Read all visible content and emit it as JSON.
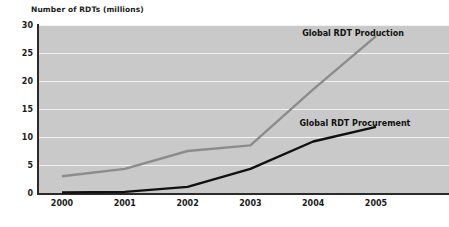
{
  "chart_data": {
    "type": "line",
    "title": "Number of RDTs (millions)",
    "xlabel": "",
    "ylabel": "Number of RDTs (millions)",
    "x": [
      "2000",
      "2001",
      "2002",
      "2003",
      "2004",
      "2005"
    ],
    "categories": [
      "2000",
      "2001",
      "2002",
      "2003",
      "2004",
      "2005"
    ],
    "series": [
      {
        "name": "Global RDT Production",
        "color": "#8c8c8c",
        "values": [
          3.0,
          4.3,
          7.5,
          8.5,
          18.5,
          28.0
        ]
      },
      {
        "name": "Global RDT Procurement",
        "color": "#111111",
        "values": [
          0.1,
          0.2,
          1.1,
          4.3,
          9.2,
          11.8
        ]
      }
    ],
    "ylim": [
      0,
      30
    ],
    "yticks": [
      0,
      5,
      10,
      15,
      20,
      25,
      30
    ],
    "ytick_labels": [
      "0",
      "5",
      "10",
      "15",
      "20",
      "25",
      "30"
    ],
    "grid": true,
    "grid_color": "#f2f2f2",
    "plot_background": "#c9c9c9",
    "axis_color": "#2b2b2b",
    "legend_position": "inline-annotations",
    "annotations": [
      {
        "text": "Global RDT Production",
        "x_px": 353,
        "y_px": 33
      },
      {
        "text": "Global RDT Procurement",
        "x_px": 355,
        "y_px": 123
      }
    ]
  },
  "labels": {
    "production": "Global RDT Production",
    "procurement": "Global RDT Procurement"
  }
}
